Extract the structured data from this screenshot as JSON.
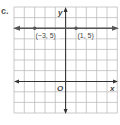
{
  "figure": {
    "part_label": "c.",
    "axes": {
      "x_label": "x",
      "y_label": "y",
      "origin_label": "O",
      "x_range": [
        -5,
        5
      ],
      "y_range": [
        -3,
        7
      ],
      "grid": true
    },
    "line": {
      "equation": "y = 5",
      "type": "horizontal",
      "arrows_both_ends": true
    },
    "points": [
      {
        "label": "(−3, 5)",
        "x": -3,
        "y": 5
      },
      {
        "label": "(1, 5)",
        "x": 1,
        "y": 5
      }
    ],
    "colors": {
      "grid": "#b8b8b8",
      "axis": "#333333",
      "line": "#555555",
      "point": "#555555"
    }
  }
}
